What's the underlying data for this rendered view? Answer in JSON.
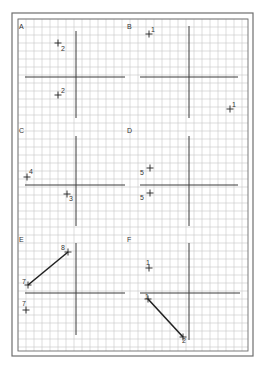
{
  "sheet": {
    "outer_border": {
      "x": 12,
      "y": 13,
      "w": 241,
      "h": 343
    },
    "grid_area": {
      "x": 18,
      "y": 19,
      "w": 230,
      "h": 332
    },
    "grid_spacing": 8,
    "colors": {
      "grid": "#c8c8c8",
      "border": "#6e6e6e",
      "axis": "#3a3a3a",
      "ink": "#222222"
    }
  },
  "panels": [
    {
      "label": "A",
      "label_pos": [
        19,
        29
      ],
      "axes": {
        "h": {
          "x1": 25,
          "x2": 125,
          "y": 77
        },
        "v": {
          "x": 76,
          "y1": 31,
          "y2": 118
        }
      },
      "points": [
        {
          "label": "2",
          "x": 58,
          "y": 43,
          "lx": 61,
          "ly": 51
        },
        {
          "label": "2",
          "x": 58,
          "y": 95,
          "lx": 61,
          "ly": 93
        }
      ],
      "segments": []
    },
    {
      "label": "B",
      "label_pos": [
        127,
        29
      ],
      "axes": {
        "h": {
          "x1": 140,
          "x2": 238,
          "y": 77
        },
        "v": {
          "x": 189,
          "y1": 26,
          "y2": 118
        }
      },
      "points": [
        {
          "label": "1",
          "x": 149,
          "y": 34,
          "lx": 151,
          "ly": 32
        },
        {
          "label": "1",
          "x": 230,
          "y": 109,
          "lx": 232,
          "ly": 107
        }
      ],
      "segments": []
    },
    {
      "label": "C",
      "label_pos": [
        19,
        133
      ],
      "axes": {
        "h": {
          "x1": 25,
          "x2": 125,
          "y": 185
        },
        "v": {
          "x": 76,
          "y1": 136,
          "y2": 226
        }
      },
      "points": [
        {
          "label": "4",
          "x": 27,
          "y": 177,
          "lx": 29,
          "ly": 174
        },
        {
          "label": "3",
          "x": 67,
          "y": 194,
          "lx": 69,
          "ly": 201
        }
      ],
      "segments": []
    },
    {
      "label": "D",
      "label_pos": [
        127,
        133
      ],
      "axes": {
        "h": {
          "x1": 140,
          "x2": 238,
          "y": 185
        },
        "v": {
          "x": 189,
          "y1": 136,
          "y2": 226
        }
      },
      "points": [
        {
          "label": "5",
          "x": 150,
          "y": 168,
          "lx": 140,
          "ly": 175
        },
        {
          "label": "5",
          "x": 150,
          "y": 193,
          "lx": 140,
          "ly": 200
        }
      ],
      "segments": []
    },
    {
      "label": "E",
      "label_pos": [
        19,
        242
      ],
      "axes": {
        "h": {
          "x1": 25,
          "x2": 125,
          "y": 293
        },
        "v": {
          "x": 76,
          "y1": 243,
          "y2": 335
        }
      },
      "points": [
        {
          "label": "7",
          "x": 28,
          "y": 285,
          "lx": 22,
          "ly": 284
        },
        {
          "label": "8",
          "x": 68,
          "y": 252,
          "lx": 61,
          "ly": 250
        },
        {
          "label": "7",
          "x": 26,
          "y": 310,
          "lx": 22,
          "ly": 306
        }
      ],
      "segments": [
        {
          "from": "7",
          "to": "8",
          "x1": 28,
          "y1": 285,
          "x2": 68,
          "y2": 252
        }
      ]
    },
    {
      "label": "F",
      "label_pos": [
        127,
        242
      ],
      "axes": {
        "h": {
          "x1": 140,
          "x2": 240,
          "y": 293
        },
        "v": {
          "x": 189,
          "y1": 243,
          "y2": 340
        }
      },
      "points": [
        {
          "label": "1",
          "x": 149,
          "y": 268,
          "lx": 146,
          "ly": 265
        },
        {
          "label": "1",
          "x": 148,
          "y": 299,
          "lx": 145,
          "ly": 299
        },
        {
          "label": "2",
          "x": 183,
          "y": 337,
          "lx": 182,
          "ly": 343
        }
      ],
      "segments": [
        {
          "from": "1",
          "to": "2",
          "x1": 148,
          "y1": 299,
          "x2": 183,
          "y2": 337
        }
      ]
    }
  ]
}
